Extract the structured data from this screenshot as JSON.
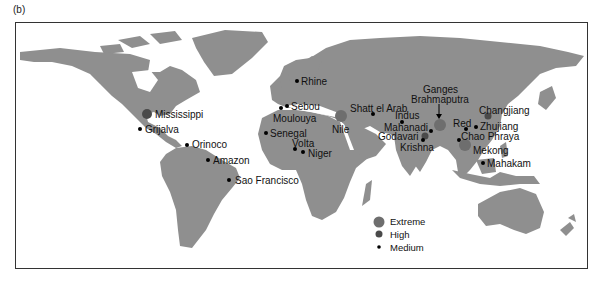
{
  "panel_label": "(b)",
  "map": {
    "land_color": "#8f8f8f",
    "background": "#ffffff",
    "colors": {
      "extreme": "#6e6e6e",
      "high": "#4a4a4a",
      "medium": "#000000"
    },
    "rivers": [
      {
        "name": "Mississippi",
        "category": "High"
      },
      {
        "name": "Grijalva",
        "category": "Medium"
      },
      {
        "name": "Orinoco",
        "category": "Medium"
      },
      {
        "name": "Amazon",
        "category": "Medium"
      },
      {
        "name": "Sao Francisco",
        "category": "Medium"
      },
      {
        "name": "Rhine",
        "category": "Medium"
      },
      {
        "name": "Sebou",
        "category": "Medium"
      },
      {
        "name": "Moulouya",
        "category": "Medium"
      },
      {
        "name": "Senegal",
        "category": "Medium"
      },
      {
        "name": "Volta",
        "category": "Medium"
      },
      {
        "name": "Niger",
        "category": "Medium"
      },
      {
        "name": "Nile",
        "category": "Extreme"
      },
      {
        "name": "Shatt el Arab",
        "category": "Medium"
      },
      {
        "name": "Indus",
        "category": "Medium"
      },
      {
        "name": "Mahanadi",
        "category": "Medium"
      },
      {
        "name": "Godavari",
        "category": "High"
      },
      {
        "name": "Krishna",
        "category": "Medium"
      },
      {
        "name": "Ganges",
        "category": "Extreme"
      },
      {
        "name": "Brahmaputra",
        "category": "Extreme"
      },
      {
        "name": "Changjiang",
        "category": "High"
      },
      {
        "name": "Red",
        "category": "Medium"
      },
      {
        "name": "Zhujiang",
        "category": "Medium"
      },
      {
        "name": "Chao Phraya",
        "category": "Medium"
      },
      {
        "name": "Mekong",
        "category": "Extreme"
      },
      {
        "name": "Mahakam",
        "category": "Medium"
      }
    ]
  },
  "legend": {
    "items": [
      {
        "label": "Extreme"
      },
      {
        "label": "High"
      },
      {
        "label": "Medium"
      }
    ]
  }
}
